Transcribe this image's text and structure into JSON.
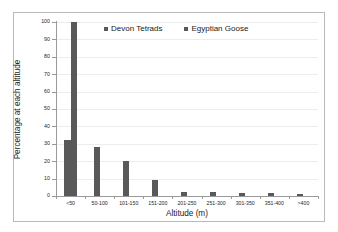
{
  "chart_data": {
    "type": "bar",
    "title": "",
    "xlabel": "Altitude (m)",
    "ylabel": "Percentage at each altitude",
    "categories": [
      "<50",
      "50-100",
      "101-150",
      "151-200",
      "201-250",
      "251-300",
      "301-350",
      "351-400",
      ">400"
    ],
    "series": [
      {
        "name": "Devon Tetrads",
        "color": "#595959",
        "values": [
          32,
          28,
          20,
          9,
          2.5,
          2.5,
          2,
          1.5,
          1.2
        ]
      },
      {
        "name": "Egyptian Goose",
        "color": "#595959",
        "values": [
          100,
          0,
          0,
          0,
          0,
          0,
          0,
          0,
          0
        ]
      }
    ],
    "ylim": [
      0,
      100
    ],
    "ytick_labels": [
      "0",
      "10",
      "20",
      "30",
      "40",
      "50",
      "60",
      "70",
      "80",
      "90",
      "100"
    ],
    "ytick_values": [
      0,
      10,
      20,
      30,
      40,
      50,
      60,
      70,
      80,
      90,
      100
    ],
    "grid": true,
    "grid_color": "#ededed",
    "legend_position": "top-center",
    "axis_color": "#9a9a9a",
    "background": "#ffffff",
    "border_color": "#b9b9b9"
  }
}
